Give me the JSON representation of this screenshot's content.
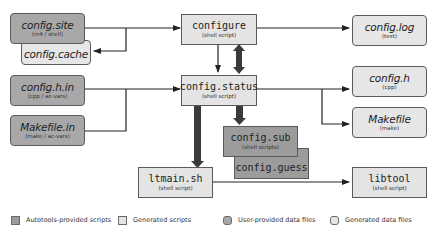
{
  "nodes": {
    "config_site": {
      "title": "config.site",
      "sub": "(m4 / shell)"
    },
    "config_cache": {
      "title": "config.cache",
      "sub": ""
    },
    "config_h_in": {
      "title": "config.h.in",
      "sub": "(cpp / ac-vars)"
    },
    "makefile_in": {
      "title": "Makefile.in",
      "sub": "(make / ac-vars)"
    },
    "configure": {
      "title": "configure",
      "sub": "(shell script)"
    },
    "config_status": {
      "title": "config.status",
      "sub": "(shell script)"
    },
    "config_sub": {
      "title": "config.sub",
      "sub": "(shell scripts)"
    },
    "config_guess": {
      "title": "config.guess",
      "sub": ""
    },
    "ltmain_sh": {
      "title": "ltmain.sh",
      "sub": "(shell script)"
    },
    "config_log": {
      "title": "config.log",
      "sub": "(text)"
    },
    "config_h": {
      "title": "config.h",
      "sub": "(cpp)"
    },
    "makefile": {
      "title": "Makefile",
      "sub": "(make)"
    },
    "libtool": {
      "title": "libtool",
      "sub": "(shell script)"
    }
  },
  "legend": [
    {
      "label": "Autotools-provided scripts",
      "color": "#9c9c9c",
      "shape": "square"
    },
    {
      "label": "Generated scripts",
      "color": "#e4e4e4",
      "shape": "square"
    },
    {
      "label": "User-provided data files",
      "color": "#a8a8a8",
      "shape": "rounded"
    },
    {
      "label": "Generated data files",
      "color": "#e6e6e6",
      "shape": "rounded"
    }
  ],
  "colors": {
    "autotools_script": "#9c9c9c",
    "generated_script": "#e4e4e4",
    "user_data": "#a8a8a8",
    "generated_data": "#e6e6e6",
    "edge": "#222222",
    "thick_edge": "#3a3a3a"
  }
}
